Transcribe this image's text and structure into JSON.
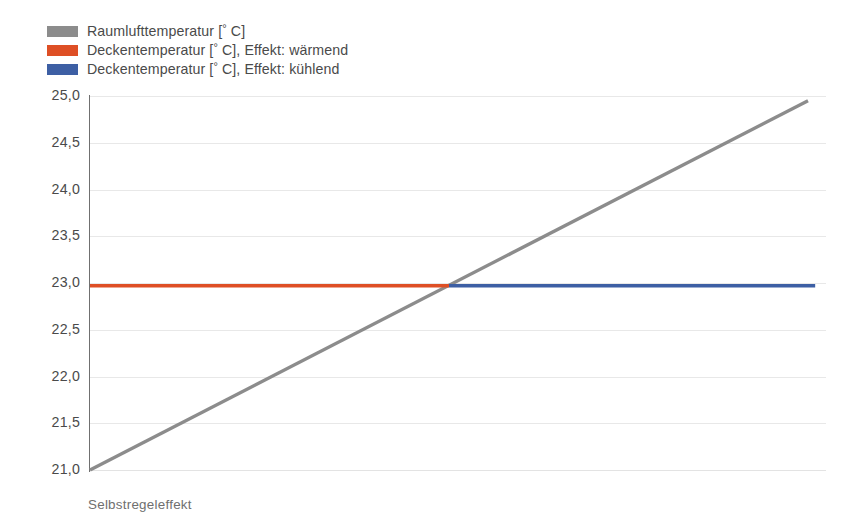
{
  "legend": {
    "position": "top-left",
    "items": [
      {
        "label": "Raumlufttemperatur [° C]",
        "color": "#8c8c8c",
        "icon": "legend-swatch-gray"
      },
      {
        "label": "Deckentemperatur [° C], Effekt: wärmend",
        "color": "#de4f25",
        "icon": "legend-swatch-red"
      },
      {
        "label": "Deckentemperatur [° C], Effekt: kühlend",
        "color": "#3d5fa4",
        "icon": "legend-swatch-blue"
      }
    ]
  },
  "caption": {
    "text": "Selbstregeleffekt"
  },
  "axis": {
    "y_ticks": [
      "25,0",
      "24,5",
      "24,0",
      "23,5",
      "23,0",
      "22,5",
      "22,0",
      "21,5",
      "21,0"
    ]
  },
  "colors": {
    "room_air": "#8c8c8c",
    "ceiling_heating": "#de4f25",
    "ceiling_cooling": "#3d5fa4",
    "axis": "#6e6e6e",
    "grid": "#e8e8e8",
    "text": "#4a4a4a",
    "caption_text": "#6f6f6f",
    "background": "#ffffff"
  },
  "chart_data": {
    "type": "line",
    "title": "",
    "subtitle": "",
    "xlabel": "",
    "ylabel": "",
    "xlim": [
      0,
      100
    ],
    "ylim": [
      21.0,
      25.0
    ],
    "yticks": [
      21.0,
      21.5,
      22.0,
      22.5,
      23.0,
      23.5,
      24.0,
      24.5,
      25.0
    ],
    "ytick_labels": [
      "21,0",
      "21,5",
      "22,0",
      "22,5",
      "23,0",
      "23,5",
      "24,0",
      "24,5",
      "25,0"
    ],
    "xticks": [],
    "xtick_labels": [],
    "grid": true,
    "grid_axis": "y",
    "legend_position": "top-left",
    "annotation": "Selbstregeleffekt",
    "crossover_x": 50.0,
    "crossover_y": 22.97,
    "series": [
      {
        "name": "Raumlufttemperatur [° C]",
        "color": "#8c8c8c",
        "x": [
          0,
          100
        ],
        "y": [
          21.0,
          24.95
        ]
      },
      {
        "name": "Deckentemperatur [° C], Effekt: wärmend",
        "color": "#de4f25",
        "x": [
          0,
          50
        ],
        "y": [
          22.97,
          22.97
        ]
      },
      {
        "name": "Deckentemperatur [° C], Effekt: kühlend",
        "color": "#3d5fa4",
        "x": [
          50,
          101
        ],
        "y": [
          22.97,
          22.97
        ]
      }
    ]
  }
}
